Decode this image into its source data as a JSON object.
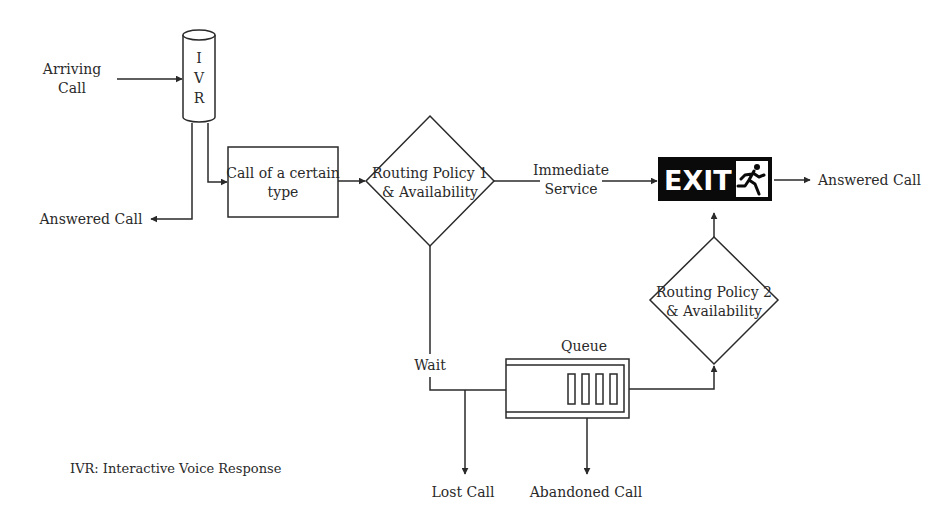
{
  "diagram": {
    "type": "call-center-flowchart",
    "nodes": {
      "arriving_call": {
        "label_lines": [
          "Arriving",
          "Call"
        ]
      },
      "ivr": {
        "letters": [
          "I",
          "V",
          "R"
        ]
      },
      "ivr_answered": {
        "label": "Answered Call"
      },
      "call_type": {
        "label_lines": [
          "Call of a certain",
          "type"
        ]
      },
      "routing1": {
        "label_lines": [
          "Routing Policy 1",
          "& Availability"
        ]
      },
      "immediate_service": {
        "label_lines": [
          "Immediate",
          "Service"
        ]
      },
      "exit": {
        "label": "EXIT",
        "icon": "running-man-icon"
      },
      "exit_answered": {
        "label": "Answered Call"
      },
      "wait": {
        "label": "Wait"
      },
      "queue": {
        "label": "Queue",
        "slots": 4
      },
      "routing2": {
        "label_lines": [
          "Routing Policy 2",
          "& Availability"
        ]
      },
      "lost_call": {
        "label": "Lost Call"
      },
      "abandoned_call": {
        "label": "Abandoned Call"
      }
    },
    "edges": [
      {
        "from": "arriving_call",
        "to": "ivr"
      },
      {
        "from": "ivr",
        "to": "ivr_answered"
      },
      {
        "from": "ivr",
        "to": "call_type"
      },
      {
        "from": "call_type",
        "to": "routing1"
      },
      {
        "from": "routing1",
        "to": "exit",
        "label": "Immediate Service"
      },
      {
        "from": "routing1",
        "to": "queue",
        "label": "Wait"
      },
      {
        "from": "wait",
        "to": "lost_call"
      },
      {
        "from": "queue",
        "to": "abandoned_call"
      },
      {
        "from": "queue",
        "to": "routing2"
      },
      {
        "from": "routing2",
        "to": "exit"
      },
      {
        "from": "exit",
        "to": "exit_answered"
      }
    ],
    "legend": "IVR: Interactive Voice Response"
  }
}
